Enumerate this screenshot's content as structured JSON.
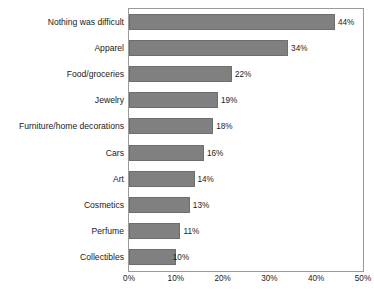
{
  "chart_data": {
    "type": "bar",
    "orientation": "horizontal",
    "title": "",
    "xlabel": "",
    "ylabel": "",
    "xlim": [
      0,
      50
    ],
    "grid": false,
    "legend": false,
    "categories": [
      "Nothing was difficult",
      "Apparel",
      "Food/groceries",
      "Jewelry",
      "Furniture/home decorations",
      "Cars",
      "Art",
      "Cosmetics",
      "Perfume",
      "Collectibles"
    ],
    "values": [
      44,
      34,
      22,
      19,
      18,
      16,
      14,
      13,
      11,
      10
    ],
    "value_labels": [
      "44%",
      "34%",
      "22%",
      "19%",
      "18%",
      "16%",
      "14%",
      "13%",
      "11%",
      "10%"
    ],
    "xticks": [
      0,
      10,
      20,
      30,
      40,
      50
    ],
    "xtick_labels": [
      "0%",
      "10%",
      "20%",
      "30%",
      "40%",
      "50%"
    ],
    "bar_color": "#808080",
    "frame_color": "#9a9a9a",
    "text_color": "#1a1a1a",
    "background": "#ffffff"
  }
}
